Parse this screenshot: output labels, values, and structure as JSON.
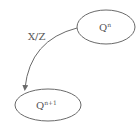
{
  "diagram": {
    "type": "state-transition",
    "nodes": [
      {
        "id": "top",
        "label_base": "Q",
        "label_sup": "n"
      },
      {
        "id": "bottom",
        "label_base": "Q",
        "label_sup": "n+1"
      }
    ],
    "edges": [
      {
        "from": "top",
        "to": "bottom",
        "label": "X/Z"
      }
    ],
    "colors": {
      "stroke": "#6a6a6a",
      "text": "#555555",
      "background": "#ffffff"
    }
  }
}
